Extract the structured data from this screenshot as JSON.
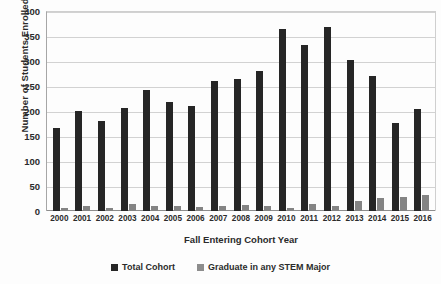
{
  "chart_data": {
    "type": "bar",
    "title": "",
    "xlabel": "Fall Entering Cohort Year",
    "ylabel": "Number of Students Enrolled",
    "categories": [
      "2000",
      "2001",
      "2002",
      "2003",
      "2004",
      "2005",
      "2006",
      "2007",
      "2008",
      "2009",
      "2010",
      "2011",
      "2012",
      "2013",
      "2014",
      "2015",
      "2016"
    ],
    "series": [
      {
        "name": "Total Cohort",
        "color": "#262626",
        "values": [
          166,
          200,
          181,
          207,
          243,
          218,
          211,
          260,
          265,
          280,
          365,
          332,
          368,
          302,
          270,
          177,
          205
        ]
      },
      {
        "name": "Graduate in any STEM Major",
        "color": "#848484",
        "values": [
          6,
          11,
          6,
          14,
          10,
          10,
          9,
          10,
          12,
          10,
          6,
          15,
          11,
          21,
          27,
          29,
          33
        ]
      }
    ],
    "ylim": [
      0,
      400
    ],
    "yticks": [
      400,
      350,
      300,
      250,
      200,
      150,
      100,
      50,
      0
    ],
    "grid": true,
    "legend_position": "bottom"
  },
  "legend": {
    "items": [
      {
        "label": "Total Cohort"
      },
      {
        "label": "Graduate in any STEM Major"
      }
    ]
  }
}
